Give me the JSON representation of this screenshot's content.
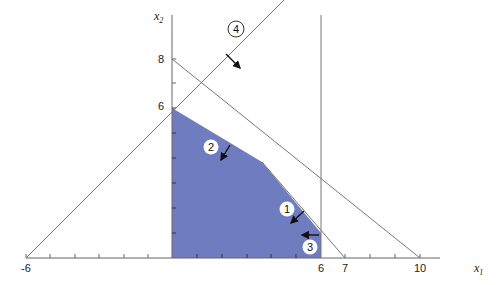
{
  "diagram": {
    "type": "linear-programming-feasible-region",
    "axes": {
      "x_label": "x",
      "x_sub": "1",
      "y_label": "x",
      "y_sub": "2",
      "x_tick_labels": [
        "-6",
        "6",
        "7",
        "10"
      ],
      "y_tick_labels": [
        "6",
        "8"
      ]
    },
    "constraints": [
      {
        "id": "1",
        "label": "1"
      },
      {
        "id": "2",
        "label": "2"
      },
      {
        "id": "3",
        "label": "3"
      },
      {
        "id": "4",
        "label": "4"
      }
    ],
    "colors": {
      "feasible_region": "#6f7dc0",
      "lines": "#777777",
      "arrows": "#111111"
    }
  }
}
